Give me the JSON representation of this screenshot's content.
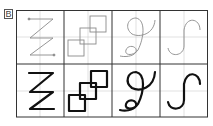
{
  "figure": {
    "label": "B",
    "columns": [
      {
        "shape": "zigzag-z",
        "name": "Z zigzag"
      },
      {
        "shape": "overlapping-squares",
        "name": "three overlapping squares"
      },
      {
        "shape": "loop-curve",
        "name": "looped curve (like a 9/g)"
      },
      {
        "shape": "s-hook",
        "name": "S hook / integral curve"
      }
    ],
    "rows": [
      {
        "name": "guide-row",
        "style": "thin gray trace"
      },
      {
        "name": "practice-row",
        "style": "bold black stroke"
      }
    ]
  }
}
